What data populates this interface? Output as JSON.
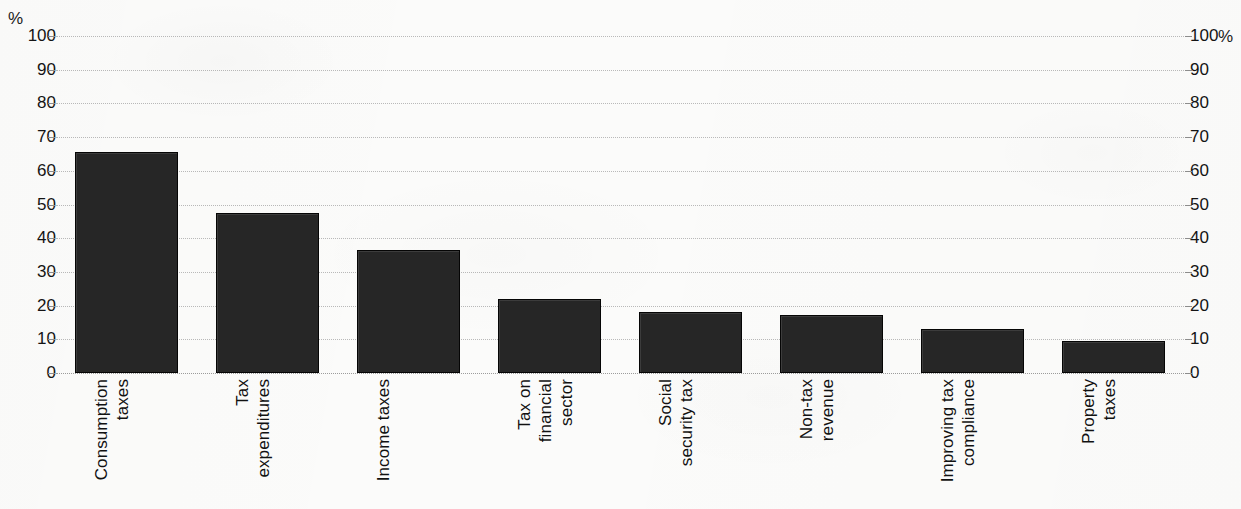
{
  "axes": {
    "left_unit": "%",
    "right_unit": "%",
    "ticks": [
      "100",
      "90",
      "80",
      "70",
      "60",
      "50",
      "40",
      "30",
      "20",
      "10",
      "0"
    ]
  },
  "chart_data": {
    "type": "bar",
    "title": "",
    "subtitle": "",
    "xlabel": "",
    "ylabel": "%",
    "ylabel_right": "%",
    "ylim": [
      0,
      100
    ],
    "ytick_step": 10,
    "grid": true,
    "legend": "none",
    "bar_color": "#262626",
    "background_color": "#fbfbfa",
    "gridline_color": "#b9b9b9",
    "categories": [
      "Consumption taxes",
      "Tax expenditures",
      "Income taxes",
      "Tax on financial sector",
      "Social security tax",
      "Non-tax revenue",
      "Improving tax compliance",
      "Property taxes"
    ],
    "category_lines": [
      [
        "Consumption",
        "taxes"
      ],
      [
        "Tax",
        "expenditures"
      ],
      [
        "Income taxes"
      ],
      [
        "Tax on",
        "financial",
        "sector"
      ],
      [
        "Social",
        "security tax"
      ],
      [
        "Non-tax",
        "revenue"
      ],
      [
        "Improving tax",
        "compliance"
      ],
      [
        "Property",
        "taxes"
      ]
    ],
    "values": [
      65.5,
      47.5,
      36.5,
      22.0,
      18.2,
      17.3,
      13.2,
      9.6
    ]
  }
}
